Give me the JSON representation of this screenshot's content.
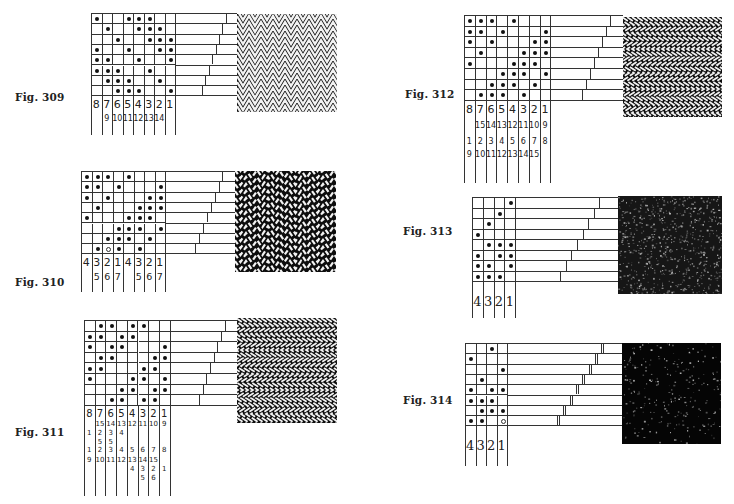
{
  "figures": [
    {
      "id": "fig-309",
      "label": "Fig. 309",
      "cols": 8,
      "rows": 8,
      "dots": [
        [
          1,
          0,
          0,
          1,
          1,
          1,
          0,
          0
        ],
        [
          0,
          1,
          0,
          0,
          1,
          1,
          1,
          0
        ],
        [
          0,
          0,
          1,
          0,
          0,
          1,
          1,
          1
        ],
        [
          1,
          0,
          0,
          1,
          0,
          0,
          1,
          1
        ],
        [
          1,
          1,
          0,
          0,
          1,
          0,
          0,
          1
        ],
        [
          1,
          1,
          1,
          0,
          0,
          1,
          0,
          0
        ],
        [
          0,
          1,
          1,
          1,
          0,
          0,
          1,
          0
        ],
        [
          0,
          0,
          1,
          1,
          1,
          0,
          0,
          1
        ]
      ],
      "numbering": [
        [
          "8",
          "7",
          "6",
          "5",
          "4",
          "3",
          "2",
          "1"
        ],
        [
          "",
          "9",
          "10",
          "11",
          "12",
          "13",
          "14",
          ""
        ]
      ],
      "swatch": "zigzag-fine"
    },
    {
      "id": "fig-310",
      "label": "Fig. 310",
      "cols": 8,
      "rows": 8,
      "dots": [
        [
          1,
          1,
          1,
          0,
          1,
          0,
          0,
          0
        ],
        [
          1,
          1,
          0,
          1,
          0,
          0,
          0,
          1
        ],
        [
          1,
          0,
          1,
          0,
          0,
          0,
          1,
          1
        ],
        [
          0,
          1,
          0,
          0,
          0,
          1,
          1,
          1
        ],
        [
          1,
          0,
          0,
          0,
          1,
          1,
          1,
          0
        ],
        [
          0,
          0,
          0,
          1,
          1,
          1,
          0,
          1
        ],
        [
          0,
          0,
          1,
          1,
          1,
          0,
          1,
          0
        ],
        [
          0,
          1,
          2,
          1,
          0,
          1,
          0,
          0
        ]
      ],
      "numbering": [
        [
          "4",
          "3",
          "2",
          "1",
          "4",
          "3",
          "2",
          "1"
        ],
        [
          "",
          "5",
          "6",
          "7",
          "",
          "5",
          "6",
          "7"
        ]
      ],
      "swatch": "wavy"
    },
    {
      "id": "fig-311",
      "label": "Fig. 311",
      "cols": 8,
      "rows": 8,
      "dots": [
        [
          0,
          1,
          1,
          0,
          1,
          1,
          0,
          0
        ],
        [
          1,
          1,
          0,
          1,
          1,
          0,
          0,
          0
        ],
        [
          1,
          0,
          1,
          1,
          0,
          0,
          0,
          1
        ],
        [
          0,
          1,
          1,
          0,
          0,
          0,
          1,
          1
        ],
        [
          1,
          1,
          0,
          0,
          0,
          1,
          1,
          0
        ],
        [
          1,
          0,
          0,
          0,
          1,
          1,
          0,
          1
        ],
        [
          0,
          0,
          0,
          1,
          1,
          0,
          1,
          1
        ],
        [
          0,
          0,
          1,
          1,
          0,
          1,
          1,
          0
        ]
      ],
      "numbering": [
        [
          "8",
          "7",
          "6",
          "5",
          "4",
          "3",
          "2",
          "1"
        ],
        [
          "",
          "15",
          "14",
          "13",
          "12",
          "11",
          "10",
          "9"
        ],
        [
          "1",
          "2",
          "3",
          "4",
          "",
          "",
          "",
          ""
        ],
        [
          "",
          "5",
          "5",
          "",
          "",
          "",
          "",
          ""
        ],
        [
          "1",
          "2",
          "3",
          "4",
          "5",
          "6",
          "7",
          "8"
        ],
        [
          "9",
          "10",
          "11",
          "12",
          "13",
          "14",
          "15",
          ""
        ],
        [
          "",
          "",
          "",
          "",
          "4",
          "3",
          "2",
          "1"
        ],
        [
          "",
          "",
          "",
          "",
          "",
          "5",
          "6",
          ""
        ]
      ],
      "swatch": "zigzag-broad"
    },
    {
      "id": "fig-312",
      "label": "Fig. 312",
      "cols": 8,
      "rows": 8,
      "dots": [
        [
          1,
          1,
          1,
          0,
          1,
          0,
          0,
          0
        ],
        [
          1,
          1,
          0,
          1,
          0,
          0,
          0,
          1
        ],
        [
          1,
          0,
          1,
          0,
          0,
          0,
          1,
          1
        ],
        [
          0,
          1,
          0,
          0,
          0,
          1,
          1,
          1
        ],
        [
          1,
          0,
          0,
          0,
          1,
          1,
          1,
          0
        ],
        [
          0,
          0,
          0,
          1,
          1,
          1,
          0,
          1
        ],
        [
          0,
          0,
          1,
          1,
          1,
          0,
          1,
          0
        ],
        [
          0,
          1,
          1,
          1,
          0,
          1,
          0,
          0
        ]
      ],
      "numbering": [
        [
          "8",
          "7",
          "6",
          "5",
          "4",
          "3",
          "2",
          "1"
        ],
        [
          "",
          "15",
          "14",
          "13",
          "12",
          "11",
          "10",
          "9"
        ],
        [
          "1",
          "2",
          "3",
          "4",
          "5",
          "6",
          "7",
          "8"
        ],
        [
          "9",
          "10",
          "11",
          "12",
          "13",
          "14",
          "15",
          ""
        ]
      ],
      "swatch": "zigzag-broad"
    },
    {
      "id": "fig-313",
      "label": "Fig. 313",
      "cols": 4,
      "rows": 8,
      "dots": [
        [
          0,
          0,
          0,
          1
        ],
        [
          0,
          0,
          1,
          0
        ],
        [
          0,
          1,
          0,
          0
        ],
        [
          1,
          0,
          0,
          0
        ],
        [
          0,
          1,
          1,
          1
        ],
        [
          1,
          0,
          1,
          1
        ],
        [
          1,
          1,
          0,
          1
        ],
        [
          1,
          1,
          1,
          0
        ]
      ],
      "numbering": [
        [
          "4",
          "3",
          "2",
          "1"
        ]
      ],
      "swatch": "dark-speckle"
    },
    {
      "id": "fig-314",
      "label": "Fig. 314",
      "cols": 4,
      "rows": 8,
      "dots": [
        [
          0,
          0,
          1,
          0
        ],
        [
          1,
          0,
          0,
          0
        ],
        [
          0,
          0,
          0,
          1
        ],
        [
          0,
          1,
          0,
          0
        ],
        [
          1,
          0,
          1,
          1
        ],
        [
          1,
          1,
          1,
          0
        ],
        [
          0,
          1,
          1,
          1
        ],
        [
          1,
          1,
          0,
          2
        ]
      ],
      "numbering": [
        [
          "4",
          "3",
          "2",
          "1"
        ]
      ],
      "swatch": "darker-speckle"
    }
  ],
  "colors": {
    "ink": "#1a1a1a",
    "paper": "#ffffff",
    "fabric_dark": "#0d0d0d",
    "fabric_light": "#f2f2f2"
  }
}
